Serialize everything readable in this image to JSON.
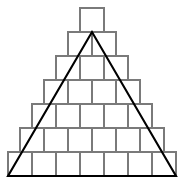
{
  "figure": {
    "type": "geometry-diagram",
    "background_color": "#ffffff",
    "canvas": {
      "width": 184,
      "height": 186
    },
    "pyramid": {
      "shape": "stepped pyramid of unit squares",
      "rows_count": 7,
      "squares_per_row": [
        1,
        2,
        3,
        4,
        5,
        6,
        7
      ],
      "total_squares": 28,
      "cell_size": 24,
      "grid_stroke_color": "#7a7a7a",
      "grid_stroke_width": 1.2,
      "cell_fill": "#ffffff",
      "rows": [
        {
          "index": 1,
          "count": 1,
          "y_top": 8,
          "x_left": 80
        },
        {
          "index": 2,
          "count": 2,
          "y_top": 32,
          "x_left": 68
        },
        {
          "index": 3,
          "count": 3,
          "y_top": 56,
          "x_left": 56
        },
        {
          "index": 4,
          "count": 4,
          "y_top": 80,
          "x_left": 44
        },
        {
          "index": 5,
          "count": 5,
          "y_top": 104,
          "x_left": 32
        },
        {
          "index": 6,
          "count": 6,
          "y_top": 128,
          "x_left": 20
        },
        {
          "index": 7,
          "count": 7,
          "y_top": 152,
          "x_left": 8
        }
      ]
    },
    "triangle": {
      "shape": "isosceles triangle overlay",
      "stroke_color": "#000000",
      "stroke_width": 2.1,
      "fill": "none",
      "apex": {
        "x": 92,
        "y": 32
      },
      "bottom_left": {
        "x": 8,
        "y": 176
      },
      "bottom_right": {
        "x": 176,
        "y": 176
      }
    }
  }
}
